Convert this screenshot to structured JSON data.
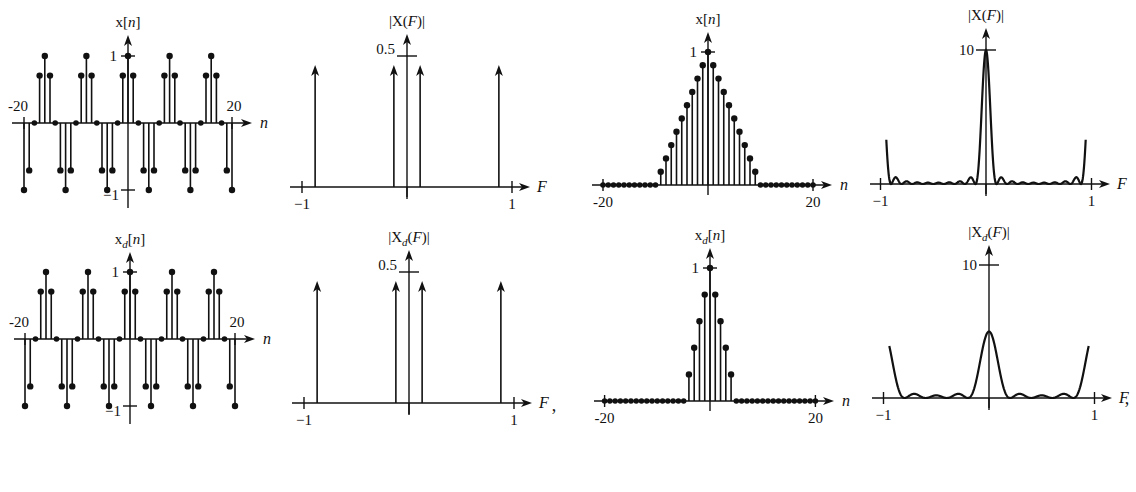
{
  "chart_data": [
    {
      "id": "p1",
      "type": "stem",
      "title": "x[n]",
      "xlabel": "n",
      "xticks": [
        "-20",
        "20"
      ],
      "yticks": [
        "1",
        "-1"
      ],
      "xlim": [
        -20,
        20
      ],
      "ylim": [
        -1,
        1
      ],
      "signal": "cos(2*pi*n/8)",
      "n_range": [
        -20,
        20
      ],
      "frame": {
        "x0": 128,
        "y0": 123,
        "sx": 5.2,
        "sy": 67,
        "axL": 12,
        "axR": 252,
        "axT": 35,
        "axB": 208
      }
    },
    {
      "id": "p2",
      "type": "impulse",
      "title": "|X(F)|",
      "xlabel": "F",
      "xticks": [
        "-1",
        "1"
      ],
      "yticks": [
        "0.5"
      ],
      "xlim": [
        -1,
        1
      ],
      "ylim": [
        0,
        0.5
      ],
      "impulses": [
        {
          "F": -0.875,
          "mag": 0.5
        },
        {
          "F": -0.125,
          "mag": 0.5
        },
        {
          "F": 0.125,
          "mag": 0.5
        },
        {
          "F": 0.875,
          "mag": 0.5
        }
      ],
      "frame": {
        "x0": 407,
        "y0": 187,
        "sx": 105,
        "sy": 264,
        "axL": 290,
        "axR": 530,
        "axT": 34,
        "axB": 197
      }
    },
    {
      "id": "p3",
      "type": "stem",
      "title": "x[n]",
      "xlabel": "n",
      "xticks": [
        "-20",
        "20"
      ],
      "yticks": [
        "1"
      ],
      "xlim": [
        -20,
        20
      ],
      "ylim": [
        0,
        1
      ],
      "signal": "triangle: 1-|n|/10 for |n|<10, else 0",
      "n_range": [
        -20,
        20
      ],
      "frame": {
        "x0": 708,
        "y0": 185,
        "sx": 5.25,
        "sy": 133,
        "axL": 592,
        "axR": 832,
        "axT": 32,
        "axB": 195
      }
    },
    {
      "id": "p4",
      "type": "line",
      "title": "|X(F)|",
      "xlabel": "F",
      "xticks": [
        "-1",
        "1"
      ],
      "yticks": [
        "10"
      ],
      "xlim": [
        -1,
        1
      ],
      "ylim": [
        0,
        10
      ],
      "signal": "|DTFT of triangle|, peak 10 at F=0, period 1",
      "peak": 10,
      "frame": {
        "x0": 986,
        "y0": 184,
        "sx": 105.5,
        "sy": 13.4,
        "axL": 870,
        "axR": 1110,
        "axT": 28,
        "axB": 194
      }
    },
    {
      "id": "p5",
      "type": "stem",
      "title": "x_d[n]",
      "xlabel": "n",
      "xticks": [
        "-20",
        "20"
      ],
      "yticks": [
        "1",
        "-1"
      ],
      "xlim": [
        -20,
        20
      ],
      "ylim": [
        -1,
        1
      ],
      "signal": "cos(2*pi*n/8)",
      "n_range": [
        -20,
        20
      ],
      "frame": {
        "x0": 130,
        "y0": 339,
        "sx": 5.25,
        "sy": 67,
        "axL": 14,
        "axR": 255,
        "axT": 252,
        "axB": 424
      }
    },
    {
      "id": "p6",
      "type": "impulse",
      "title": "|X_d(F)|",
      "xlabel": "F",
      "xticks": [
        "-1",
        "1"
      ],
      "yticks": [
        "0.5"
      ],
      "xlim": [
        -1,
        1
      ],
      "ylim": [
        0,
        0.5
      ],
      "impulses": [
        {
          "F": -0.875,
          "mag": 0.5
        },
        {
          "F": -0.125,
          "mag": 0.5
        },
        {
          "F": 0.125,
          "mag": 0.5
        },
        {
          "F": 0.875,
          "mag": 0.5
        }
      ],
      "frame": {
        "x0": 409,
        "y0": 403,
        "sx": 105,
        "sy": 264,
        "axL": 292,
        "axR": 532,
        "axT": 250,
        "axB": 414
      }
    },
    {
      "id": "p7",
      "type": "stem",
      "title": "x_d[n]",
      "xlabel": "n",
      "xticks": [
        "-20",
        "20"
      ],
      "yticks": [
        "1"
      ],
      "xlim": [
        -20,
        20
      ],
      "ylim": [
        0,
        1
      ],
      "signal": "decimated triangle x[2n]: 1-|n|/5 for |n|<5, else 0",
      "n_range": [
        -20,
        20
      ],
      "frame": {
        "x0": 710,
        "y0": 401,
        "sx": 5.27,
        "sy": 133,
        "axL": 594,
        "axR": 834,
        "axT": 248,
        "axB": 411
      }
    },
    {
      "id": "p8",
      "type": "line",
      "title": "|X_d(F)|",
      "xlabel": "F",
      "xticks": [
        "-1",
        "1"
      ],
      "yticks": [
        "10"
      ],
      "xlim": [
        -1,
        1
      ],
      "ylim": [
        0,
        10
      ],
      "signal": "|DTFT of decimated triangle|, peak 5 at F=0, period 1",
      "peak": 5,
      "frame": {
        "x0": 989,
        "y0": 398,
        "sx": 105.5,
        "sy": 13.3,
        "axL": 872,
        "axR": 1112,
        "axT": 245,
        "axB": 408
      }
    }
  ],
  "punctuation": [
    {
      "text": ",",
      "x": 554,
      "y": 411
    },
    {
      "text": ",",
      "x": 1127,
      "y": 404
    }
  ]
}
